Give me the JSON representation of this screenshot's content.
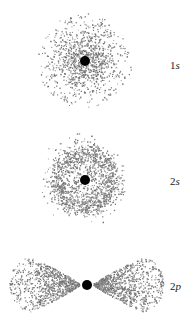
{
  "figure": {
    "width": 194,
    "height": 321,
    "background": "#ffffff",
    "dot_color": "#7a7a7a",
    "nucleus_color": "#000000"
  },
  "orbitals": [
    {
      "id": "1s",
      "label_number": "1",
      "label_symbol": "s",
      "label_pos": {
        "x": 170,
        "y": 60
      },
      "type": "s",
      "center": {
        "x": 85,
        "y": 61
      },
      "nucleus_radius": 5,
      "outer_radius": 48,
      "dot_count": 1100,
      "radial_profile": "1s",
      "seed": 11
    },
    {
      "id": "2s",
      "label_number": "2",
      "label_symbol": "s",
      "label_pos": {
        "x": 170,
        "y": 176
      },
      "type": "s",
      "center": {
        "x": 85,
        "y": 180
      },
      "nucleus_radius": 5,
      "outer_radius": 49,
      "dot_count": 1500,
      "radial_profile": "2s",
      "seed": 23
    },
    {
      "id": "2p",
      "label_number": "2",
      "label_symbol": "p",
      "label_pos": {
        "x": 170,
        "y": 281
      },
      "type": "p",
      "center": {
        "x": 87,
        "y": 285
      },
      "nucleus_radius": 5,
      "lobe_length": 77,
      "lobe_half_width": 27,
      "dot_count": 1800,
      "radial_profile": "2p",
      "seed": 37
    }
  ]
}
